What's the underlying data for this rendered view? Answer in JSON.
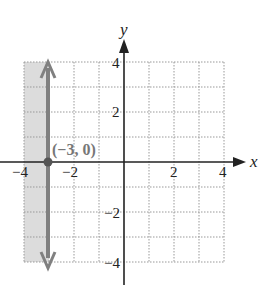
{
  "graph": {
    "x_axis_label": "x",
    "y_axis_label": "y",
    "x_range": [
      -4,
      4
    ],
    "y_range": [
      -4,
      4
    ],
    "grid_step": 1,
    "x_tick_labels": [
      "-4",
      "-2",
      "2",
      "4"
    ],
    "y_tick_labels": [
      "4",
      "2",
      "-2",
      "-4"
    ],
    "x_ticks": {
      "neg4": "−4",
      "neg2": "−2",
      "pos2": "2",
      "pos4": "4"
    },
    "y_ticks": {
      "pos4": "4",
      "pos2": "2",
      "neg2": "−2",
      "neg4": "−4"
    },
    "vertical_line": {
      "x": -3,
      "equation": "x = -3"
    },
    "point": {
      "x": -3,
      "y": 0,
      "label": "(−3, 0)"
    },
    "shaded_region": {
      "x_min": -4,
      "x_max": -3,
      "description": "x < -3"
    },
    "colors": {
      "line": "#808080",
      "shade": "#dcdcdc",
      "grid": "#999999",
      "axis": "#222222"
    }
  }
}
